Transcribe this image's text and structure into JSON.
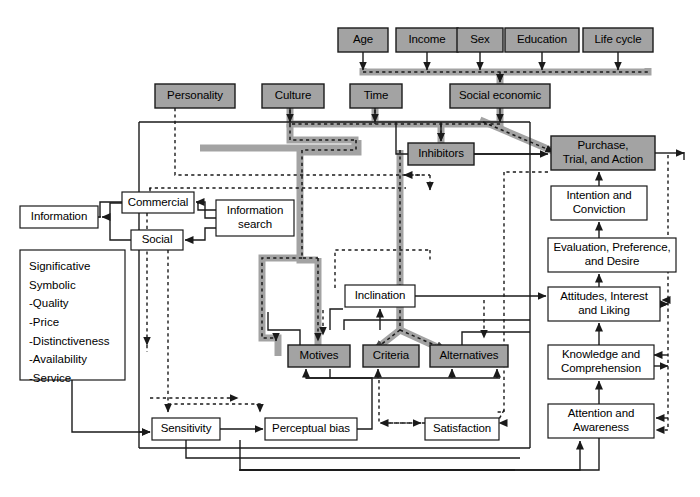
{
  "diagram": {
    "colors": {
      "shaded_fill": "#a3a3a3",
      "plain_fill": "#ffffff",
      "stroke": "#1a1a1a",
      "highlight_path": "#a3a3a3",
      "background": "#ffffff"
    },
    "nodes": [
      {
        "id": "age",
        "label": "Age",
        "shaded": true,
        "x": 338,
        "y": 28,
        "w": 50,
        "h": 24
      },
      {
        "id": "income",
        "label": "Income",
        "shaded": true,
        "x": 396,
        "y": 28,
        "w": 62,
        "h": 24
      },
      {
        "id": "sex",
        "label": "Sex",
        "shaded": true,
        "x": 457,
        "y": 28,
        "w": 46,
        "h": 24
      },
      {
        "id": "education",
        "label": "Education",
        "shaded": true,
        "x": 505,
        "y": 28,
        "w": 74,
        "h": 24
      },
      {
        "id": "lifecycle",
        "label": "Life cycle",
        "shaded": true,
        "x": 583,
        "y": 28,
        "w": 70,
        "h": 24
      },
      {
        "id": "personality",
        "label": "Personality",
        "shaded": true,
        "x": 155,
        "y": 84,
        "w": 80,
        "h": 24
      },
      {
        "id": "culture",
        "label": "Culture",
        "shaded": true,
        "x": 262,
        "y": 84,
        "w": 62,
        "h": 24
      },
      {
        "id": "time",
        "label": "Time",
        "shaded": true,
        "x": 350,
        "y": 84,
        "w": 52,
        "h": 24
      },
      {
        "id": "socialecon",
        "label": "Social economic",
        "shaded": true,
        "x": 450,
        "y": 84,
        "w": 100,
        "h": 24
      },
      {
        "id": "inhibitors",
        "label": "Inhibitors",
        "shaded": true,
        "x": 408,
        "y": 143,
        "w": 66,
        "h": 22
      },
      {
        "id": "purchase",
        "label": "Purchase,\nTrial, and Action",
        "shaded": true,
        "x": 551,
        "y": 136,
        "w": 104,
        "h": 34
      },
      {
        "id": "intention",
        "label": "Intention and\nConviction",
        "shaded": false,
        "x": 551,
        "y": 186,
        "w": 96,
        "h": 34
      },
      {
        "id": "evaluation",
        "label": "Evaluation, Preference,\nand Desire",
        "shaded": false,
        "x": 548,
        "y": 238,
        "w": 128,
        "h": 34
      },
      {
        "id": "attitudes",
        "label": "Attitudes, Interest\nand Liking",
        "shaded": false,
        "x": 548,
        "y": 287,
        "w": 112,
        "h": 34
      },
      {
        "id": "knowledge",
        "label": "Knowledge and\nComprehension",
        "shaded": false,
        "x": 548,
        "y": 345,
        "w": 106,
        "h": 34
      },
      {
        "id": "attention",
        "label": "Attention and\nAwareness",
        "shaded": false,
        "x": 548,
        "y": 404,
        "w": 106,
        "h": 34
      },
      {
        "id": "commercial",
        "label": "Commercial",
        "shaded": false,
        "x": 122,
        "y": 192,
        "w": 72,
        "h": 21
      },
      {
        "id": "social",
        "label": "Social",
        "shaded": false,
        "x": 131,
        "y": 230,
        "w": 52,
        "h": 20
      },
      {
        "id": "information",
        "label": "Information",
        "shaded": false,
        "x": 20,
        "y": 206,
        "w": 78,
        "h": 22
      },
      {
        "id": "infosearch",
        "label": "Information\nsearch",
        "shaded": false,
        "x": 216,
        "y": 200,
        "w": 78,
        "h": 36
      },
      {
        "id": "inclination",
        "label": "Inclination",
        "shaded": false,
        "x": 345,
        "y": 285,
        "w": 70,
        "h": 22
      },
      {
        "id": "motives",
        "label": "Motives",
        "shaded": true,
        "x": 288,
        "y": 345,
        "w": 62,
        "h": 22
      },
      {
        "id": "criteria",
        "label": "Criteria",
        "shaded": true,
        "x": 363,
        "y": 345,
        "w": 56,
        "h": 22
      },
      {
        "id": "alternatives",
        "label": "Alternatives",
        "shaded": true,
        "x": 430,
        "y": 345,
        "w": 78,
        "h": 22
      },
      {
        "id": "sensitivity",
        "label": "Sensitivity",
        "shaded": false,
        "x": 152,
        "y": 418,
        "w": 68,
        "h": 22
      },
      {
        "id": "perceptual",
        "label": "Perceptual bias",
        "shaded": false,
        "x": 265,
        "y": 418,
        "w": 92,
        "h": 22
      },
      {
        "id": "satisfaction",
        "label": "Satisfaction",
        "shaded": false,
        "x": 425,
        "y": 418,
        "w": 74,
        "h": 22
      }
    ],
    "list_box": {
      "id": "significative",
      "x": 20,
      "y": 250,
      "w": 105,
      "h": 130,
      "lines": [
        "Significative",
        "Symbolic",
        "-Quality",
        "-Price",
        "-Distinctiveness",
        "-Availability",
        "-Service"
      ]
    }
  }
}
